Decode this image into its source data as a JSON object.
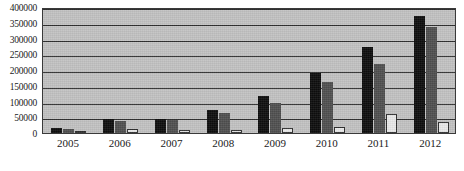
{
  "chart_data": {
    "type": "bar",
    "title": "",
    "subtitle": "",
    "xlabel": "",
    "ylabel": "",
    "categories": [
      "2005",
      "2006",
      "2007",
      "2008",
      "2009",
      "2010",
      "2011",
      "2012"
    ],
    "series": [
      {
        "name": "series-1",
        "color": "#0d0d0d",
        "values": [
          15000,
          45000,
          45000,
          72000,
          117000,
          190000,
          272000,
          370000
        ]
      },
      {
        "name": "series-2",
        "color": "#4f4f4f",
        "values": [
          12000,
          37000,
          40000,
          62000,
          95000,
          163000,
          218000,
          337000
        ]
      },
      {
        "name": "series-3",
        "color": "#e8e8e8",
        "values": [
          4000,
          12000,
          9000,
          10000,
          17000,
          20000,
          60000,
          36000
        ]
      }
    ],
    "ylim": [
      0,
      400000
    ],
    "ytick_values": [
      0,
      50000,
      100000,
      150000,
      200000,
      250000,
      300000,
      350000,
      400000
    ],
    "ytick_labels": [
      "0",
      "50000",
      "100000",
      "150000",
      "200000",
      "250000",
      "300000",
      "350000",
      "400000"
    ],
    "xtick_labels": [
      "2005",
      "2006",
      "2007",
      "2008",
      "2009",
      "2010",
      "2011",
      "2012"
    ],
    "grid": true,
    "grid_axis": "y",
    "legend": false,
    "legend_position": "none",
    "plot_background": "#c2c2c2",
    "figure_background": "#ffffff",
    "axis_color": "#2e2e2e"
  }
}
